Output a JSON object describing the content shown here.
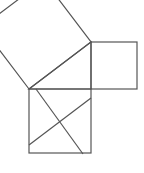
{
  "diagram": {
    "stroke_color": "#555555",
    "background": "#ffffff",
    "triangle": [
      [
        29,
        89
      ],
      [
        91,
        42
      ],
      [
        91,
        89
      ]
    ],
    "hypotenuse_square": [
      [
        29,
        89
      ],
      [
        91,
        42
      ],
      [
        44,
        -20
      ],
      [
        -18,
        27
      ]
    ],
    "right_square": {
      "x": 91,
      "y": 42,
      "w": 46,
      "h": 47
    },
    "bottom_square": {
      "x": 29,
      "y": 89,
      "w": 62,
      "h": 64
    },
    "bottom_lines": [
      [
        [
          36,
          89
        ],
        [
          83,
          154
        ]
      ],
      [
        [
          29,
          145
        ],
        [
          91,
          98
        ]
      ]
    ]
  }
}
